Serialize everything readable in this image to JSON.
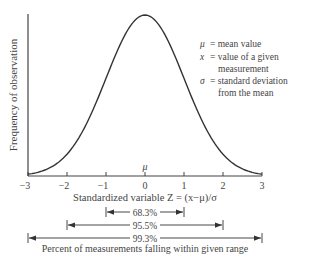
{
  "chart_data": {
    "type": "line",
    "title": "",
    "xlabel": "Standardized variable Z = (x−μ)/σ",
    "ylabel": "Frequency of observation",
    "x_ticks": [
      "−3",
      "−2",
      "−1",
      "0",
      "1",
      "2",
      "3"
    ],
    "x_tick_values": [
      -3,
      -2,
      -1,
      0,
      1,
      2,
      3
    ],
    "xlim": [
      -3,
      3
    ],
    "grid": false,
    "series": [
      {
        "name": "Normal distribution curve",
        "x": [
          -3,
          -2.5,
          -2,
          -1.5,
          -1,
          -0.5,
          0,
          0.5,
          1,
          1.5,
          2,
          2.5,
          3
        ],
        "values": [
          0.011,
          0.044,
          0.135,
          0.325,
          0.607,
          0.882,
          1.0,
          0.882,
          0.607,
          0.325,
          0.135,
          0.044,
          0.011
        ]
      }
    ],
    "annotations": {
      "mu_label": "μ",
      "legend": [
        {
          "symbol": "μ",
          "text": "= mean value"
        },
        {
          "symbol": "x",
          "text": "= value of a given",
          "cont": "measurement"
        },
        {
          "symbol": "σ",
          "text": "= standard deviation",
          "cont": "from the mean"
        }
      ],
      "ranges": [
        {
          "label": "68.3%",
          "from": -1,
          "to": 1
        },
        {
          "label": "95.5%",
          "from": -2,
          "to": 2
        },
        {
          "label": "99.3%",
          "from": -3,
          "to": 3
        }
      ],
      "range_caption": "Percent of measurements falling within given range"
    }
  }
}
